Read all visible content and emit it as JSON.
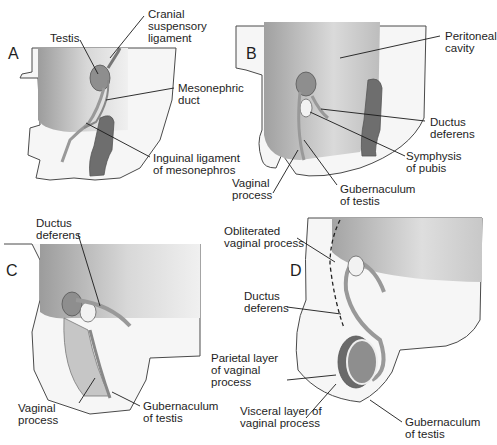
{
  "figure": {
    "colors": {
      "background": "#ffffff",
      "body_outline": "#4a4a4a",
      "body_fill": "#f4f4f4",
      "cavity_dark": "#a8a8a8",
      "cavity_light": "#e2e2e2",
      "testis": "#8e8e8e",
      "duct": "#9a9a9a",
      "rectum": "#6e6e6e",
      "leader_line": "#1a1a1a"
    },
    "panels": [
      {
        "letter": "A",
        "labels": [
          {
            "text": "Testis"
          },
          {
            "text": "Cranial\nsuspensory\nligament"
          },
          {
            "text": "Mesonephric\nduct"
          },
          {
            "text": "Inguinal ligament\nof mesonephros"
          }
        ]
      },
      {
        "letter": "B",
        "labels": [
          {
            "text": "Peritoneal\ncavity"
          },
          {
            "text": "Ductus\ndeferens"
          },
          {
            "text": "Symphysis\nof pubis"
          },
          {
            "text": "Vaginal\nprocess"
          },
          {
            "text": "Gubernaculum\nof testis"
          }
        ]
      },
      {
        "letter": "C",
        "labels": [
          {
            "text": "Ductus\ndeferens"
          },
          {
            "text": "Vaginal\nprocess"
          },
          {
            "text": "Gubernaculum\nof testis"
          }
        ]
      },
      {
        "letter": "D",
        "labels": [
          {
            "text": "Obliterated\nvaginal process"
          },
          {
            "text": "Ductus\ndeferens"
          },
          {
            "text": "Parietal layer\nof vaginal\nprocess"
          },
          {
            "text": "Visceral layer of\nvaginal process"
          },
          {
            "text": "Gubernaculum\nof testis"
          }
        ]
      }
    ]
  }
}
